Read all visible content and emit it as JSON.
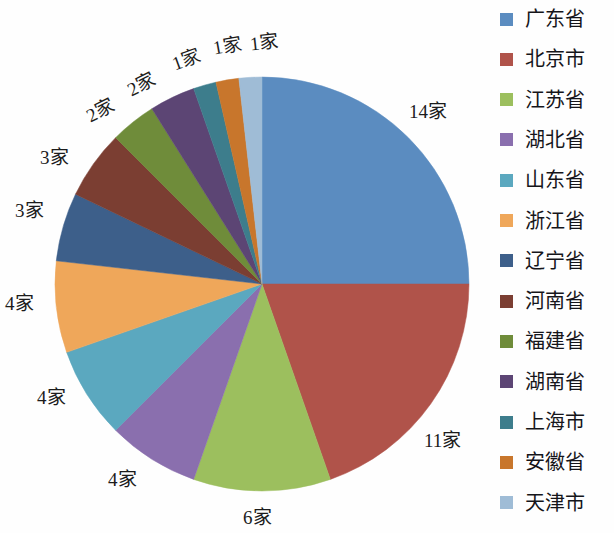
{
  "chart_data": {
    "type": "pie",
    "title": "",
    "unit_suffix": "家",
    "total": 56,
    "start_angle_deg": 0,
    "direction": "clockwise",
    "categories": [
      "广东省",
      "北京市",
      "江苏省",
      "湖北省",
      "山东省",
      "浙江省",
      "辽宁省",
      "河南省",
      "福建省",
      "湖南省",
      "上海市",
      "安徽省",
      "天津市"
    ],
    "values": [
      14,
      11,
      6,
      4,
      4,
      4,
      3,
      3,
      2,
      2,
      1,
      1,
      1
    ],
    "data_labels": [
      "14家",
      "11家",
      "6家",
      "4家",
      "4家",
      "4家",
      "3家",
      "3家",
      "2家",
      "2家",
      "1家",
      "1家",
      "1家"
    ],
    "colors": [
      "#5b8cc0",
      "#b0534a",
      "#9cbf5e",
      "#8a6fae",
      "#5ba8bf",
      "#efa75a",
      "#3d5f8a",
      "#7b3e32",
      "#6f8c3a",
      "#5c4574",
      "#3d7d8c",
      "#c8762c",
      "#9fbcd6"
    ],
    "legend_position": "right",
    "grid": false,
    "xlabel": "",
    "ylabel": ""
  },
  "legend": {
    "items": [
      {
        "label": "广东省",
        "color": "#5b8cc0"
      },
      {
        "label": "北京市",
        "color": "#b0534a"
      },
      {
        "label": "江苏省",
        "color": "#9cbf5e"
      },
      {
        "label": "湖北省",
        "color": "#8a6fae"
      },
      {
        "label": "山东省",
        "color": "#5ba8bf"
      },
      {
        "label": "浙江省",
        "color": "#efa75a"
      },
      {
        "label": "辽宁省",
        "color": "#3d5f8a"
      },
      {
        "label": "河南省",
        "color": "#7b3e32"
      },
      {
        "label": "福建省",
        "color": "#6f8c3a"
      },
      {
        "label": "湖南省",
        "color": "#5c4574"
      },
      {
        "label": "上海市",
        "color": "#3d7d8c"
      },
      {
        "label": "安徽省",
        "color": "#c8762c"
      },
      {
        "label": "天津市",
        "color": "#9fbcd6"
      }
    ]
  },
  "labels": {
    "l0": "14家",
    "l1": "11家",
    "l2": "6家",
    "l3": "4家",
    "l4": "4家",
    "l5": "4家",
    "l6": "3家",
    "l7": "3家",
    "l8": "2家",
    "l9": "2家",
    "l10": "1家",
    "l11": "1家",
    "l12": "1家"
  }
}
